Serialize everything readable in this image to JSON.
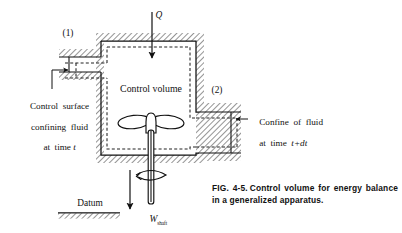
{
  "figure": {
    "number": "FIG. 4-5.",
    "caption": "Control volume for energy balance in a generalized apparatus.",
    "caption_full": "FIG. 4-5. Control volume for energy balance in a generalized apparatus."
  },
  "labels": {
    "heat_input": "Q",
    "inlet_station": "(1)",
    "outlet_station": "(2)",
    "control_volume": "Control volume",
    "control_surface": "Control surface\nconfining fluid\nat time t",
    "control_surface_line1": "Control  surface",
    "control_surface_line2": "confining  fluid",
    "control_surface_line3": "at  time ",
    "control_surface_time": "t",
    "confine": "Confine of fluid\nat time t+dt",
    "confine_line1": "Confine  of  fluid",
    "confine_line2": "at  time  ",
    "confine_time": "t+dt",
    "datum": "Datum",
    "shaft_work": "W",
    "shaft_work_sub": "shaft"
  },
  "colors": {
    "ink": "#111111",
    "hatch": "#555555",
    "background": "#ffffff",
    "dashed_surface": "#333333"
  },
  "diagram": {
    "type": "engineering-schematic",
    "elements": [
      "hatched-vessel-wall",
      "dashed-control-surface",
      "inlet-pipe-left",
      "outlet-pipe-right",
      "impeller-with-two-blades",
      "vertical-shaft",
      "rotation-arrow",
      "heat-input-arrow",
      "shaft-work-arrow",
      "datum-ground-line",
      "leader-line-to-control-surface",
      "leader-line-to-confine"
    ]
  }
}
